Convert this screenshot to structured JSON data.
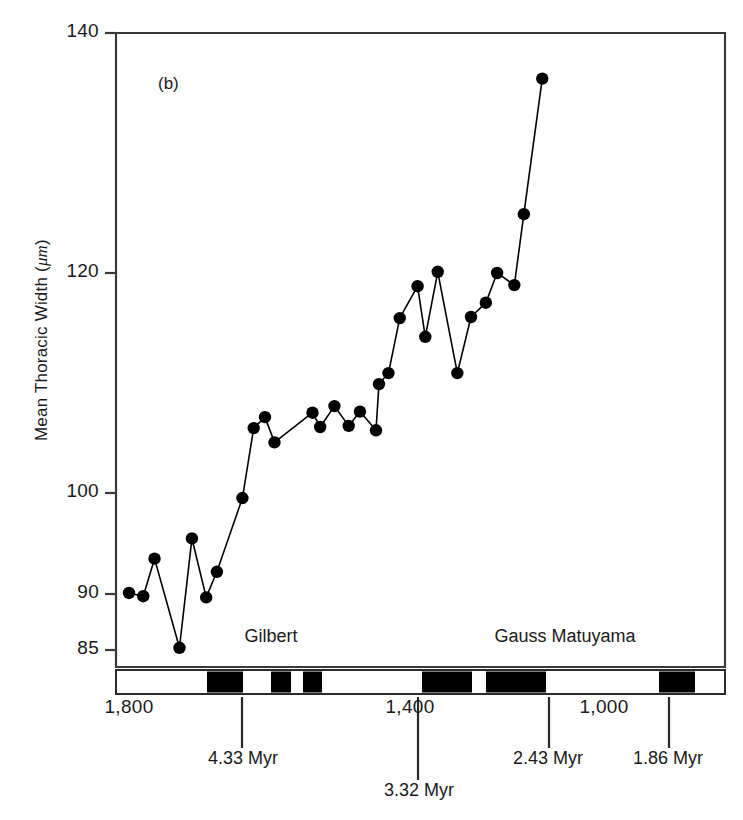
{
  "figure": {
    "panel_tag": "(b)",
    "y_axis_label": "Mean Thoracic Width (μm)"
  },
  "chart_data": {
    "type": "line",
    "title": "",
    "subtitle": "",
    "panel": "(b)",
    "xlabel": "",
    "ylabel": "Mean Thoracic Width (μm)",
    "y_unit": "μm",
    "x_unit": "stratigraphic level (cm)",
    "x_axis_direction": "decreasing left-to-right",
    "xlim": [
      1870,
      830
    ],
    "ylim": [
      85,
      140
    ],
    "y_scale": "piecewise-linear",
    "grid": false,
    "legend": null,
    "marker": "filled-circle",
    "marker_color": "#000000",
    "line_color": "#000000",
    "yticks": [
      85,
      90,
      100,
      120,
      140
    ],
    "ytick_labels": [
      "85",
      "90",
      "100",
      "120",
      "140"
    ],
    "xticks": [
      1800,
      1400,
      1000
    ],
    "xtick_labels": [
      "1,800",
      "1,400",
      "1,000"
    ],
    "x": [
      1800,
      1775,
      1755,
      1713,
      1692,
      1668,
      1650,
      1607,
      1587,
      1568,
      1552,
      1488,
      1475,
      1451,
      1427,
      1408,
      1381,
      1354,
      1338,
      1322,
      1303,
      1275,
      1262,
      1241,
      1227,
      1194,
      1171,
      1148,
      1120,
      1094,
      1068,
      1040,
      1011
    ],
    "y": [
      90.1,
      89.8,
      93.5,
      85.2,
      95.5,
      89.7,
      92.2,
      99.5,
      105.9,
      106.9,
      104.6,
      107.3,
      106.0,
      107.9,
      106.1,
      107.4,
      105.7,
      109.9,
      110.9,
      115.9,
      118.8,
      114.2,
      120.1,
      110.9,
      116.0,
      117.3,
      120.0,
      118.9,
      124.9,
      136.2
    ],
    "points": [
      {
        "x": 1800,
        "y": 90.1
      },
      {
        "x": 1776,
        "y": 89.8
      },
      {
        "x": 1757,
        "y": 93.5
      },
      {
        "x": 1715,
        "y": 85.2
      },
      {
        "x": 1694,
        "y": 95.5
      },
      {
        "x": 1670,
        "y": 89.7
      },
      {
        "x": 1652,
        "y": 92.2
      },
      {
        "x": 1609,
        "y": 99.5
      },
      {
        "x": 1590,
        "y": 105.9
      },
      {
        "x": 1571,
        "y": 106.9
      },
      {
        "x": 1555,
        "y": 104.6
      },
      {
        "x": 1491,
        "y": 107.3
      },
      {
        "x": 1478,
        "y": 106.0
      },
      {
        "x": 1454,
        "y": 107.9
      },
      {
        "x": 1430,
        "y": 106.1
      },
      {
        "x": 1411,
        "y": 107.4
      },
      {
        "x": 1384,
        "y": 105.7
      },
      {
        "x": 1379,
        "y": 109.9
      },
      {
        "x": 1363,
        "y": 110.9
      },
      {
        "x": 1344,
        "y": 115.9
      },
      {
        "x": 1314,
        "y": 118.8
      },
      {
        "x": 1301,
        "y": 114.2
      },
      {
        "x": 1280,
        "y": 120.1
      },
      {
        "x": 1247,
        "y": 110.9
      },
      {
        "x": 1224,
        "y": 116.0
      },
      {
        "x": 1199,
        "y": 117.3
      },
      {
        "x": 1180,
        "y": 120.0
      },
      {
        "x": 1151,
        "y": 118.9
      },
      {
        "x": 1135,
        "y": 124.9
      },
      {
        "x": 1104,
        "y": 136.2
      }
    ],
    "annotations": [
      {
        "label": "Gilbert",
        "type": "chron-name"
      },
      {
        "label": "Gauss Matuyama",
        "type": "chron-name"
      },
      {
        "label": "4.33 Myr",
        "type": "age-tie",
        "x": 1643
      },
      {
        "label": "3.32 Myr",
        "type": "age-tie",
        "x": 1361
      },
      {
        "label": "2.43 Myr",
        "type": "age-tie",
        "x": 1080
      },
      {
        "label": "1.86 Myr",
        "type": "age-tie",
        "x": 818
      }
    ],
    "polarity_bar": {
      "description": "magnetostratigraphic polarity column",
      "normal_color": "#000000",
      "reversed_color": "#ffffff",
      "bands": [
        {
          "polarity": "reversed",
          "x_start": 116,
          "x_end": 207
        },
        {
          "polarity": "normal",
          "x_start": 207,
          "x_end": 243
        },
        {
          "polarity": "reversed",
          "x_start": 243,
          "x_end": 271
        },
        {
          "polarity": "normal",
          "x_start": 271,
          "x_end": 291
        },
        {
          "polarity": "reversed",
          "x_start": 291,
          "x_end": 303
        },
        {
          "polarity": "normal",
          "x_start": 303,
          "x_end": 322
        },
        {
          "polarity": "reversed",
          "x_start": 322,
          "x_end": 422
        },
        {
          "polarity": "normal",
          "x_start": 422,
          "x_end": 472
        },
        {
          "polarity": "reversed",
          "x_start": 472,
          "x_end": 486
        },
        {
          "polarity": "normal",
          "x_start": 486,
          "x_end": 546
        },
        {
          "polarity": "reversed",
          "x_start": 546,
          "x_end": 659
        },
        {
          "polarity": "normal",
          "x_start": 659,
          "x_end": 695
        },
        {
          "polarity": "reversed",
          "x_start": 695,
          "x_end": 725
        }
      ]
    }
  },
  "axes": {
    "y_ticks": [
      {
        "label": "140",
        "value": 140,
        "py": 33
      },
      {
        "label": "120",
        "value": 120,
        "py": 273
      },
      {
        "label": "100",
        "value": 100,
        "py": 493
      },
      {
        "label": "90",
        "value": 90,
        "py": 594
      },
      {
        "label": "85",
        "value": 85,
        "py": 650
      }
    ],
    "x_ticks": [
      {
        "label": "1,800",
        "value": 1800,
        "px": 129
      },
      {
        "label": "1,400",
        "value": 1400,
        "px": 410
      },
      {
        "label": "1,000",
        "value": 1000,
        "px": 604
      }
    ],
    "age_ticks": [
      {
        "label": "4.33 Myr",
        "px": 242,
        "label_px": 243,
        "label_py": 758,
        "tick_top": 697,
        "tick_bottom": 748
      },
      {
        "label": "3.32 Myr",
        "px": 418,
        "label_px": 419,
        "label_py": 790,
        "tick_top": 697,
        "tick_bottom": 780
      },
      {
        "label": "2.43 Myr",
        "px": 549,
        "label_px": 548,
        "label_py": 758,
        "tick_top": 697,
        "tick_bottom": 748
      },
      {
        "label": "1.86 Myr",
        "px": 669,
        "label_px": 668,
        "label_py": 758,
        "tick_top": 697,
        "tick_bottom": 748
      }
    ]
  },
  "chrons": [
    {
      "name": "Gilbert",
      "px": 271,
      "py": 636
    },
    {
      "name": "Gauss Matuyama",
      "px": 565,
      "py": 636
    }
  ]
}
